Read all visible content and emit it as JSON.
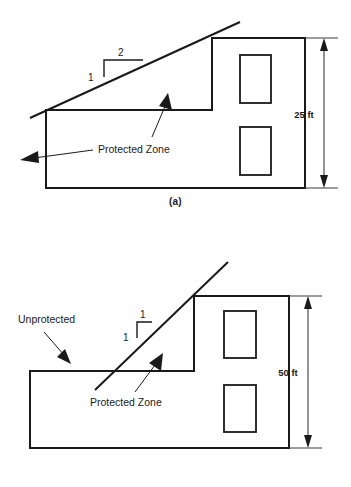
{
  "figure": {
    "type": "engineering-diagram",
    "panels": [
      {
        "id": "a",
        "caption": "(a)",
        "dimension_label": "25 ft",
        "dimension_value": 25,
        "dimension_unit": "ft",
        "slope_rise_label": "1",
        "slope_run_label": "2",
        "slope_ratio": "1:2",
        "zone_label": "Protected Zone",
        "labels": [
          "1",
          "2",
          "Protected Zone",
          "25 ft",
          "(a)"
        ],
        "windows": 2,
        "building_shape": "rectangle-with-lower-step"
      },
      {
        "id": "b",
        "caption": "(b)",
        "dimension_label": "50 ft",
        "dimension_value": 50,
        "dimension_unit": "ft",
        "slope_rise_label": "1",
        "slope_run_label": "1",
        "slope_ratio": "1:1",
        "zone_label": "Protected Zone",
        "unprotected_label": "Unprotected",
        "labels": [
          "1",
          "1",
          "Unprotected",
          "Protected Zone",
          "50 ft",
          "(b)"
        ],
        "windows": 2,
        "building_shape": "L-shaped-with-lower-wing"
      }
    ]
  },
  "colors": {
    "ink": "#1a1a1a",
    "dimension": "#3b3b3b",
    "background": "#ffffff"
  }
}
